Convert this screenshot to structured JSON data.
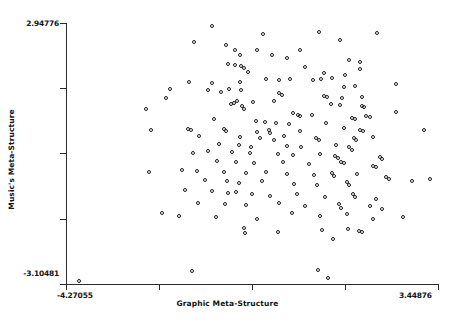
{
  "chart_data": {
    "type": "scatter",
    "title": "",
    "xlabel": "Graphic Meta-Structure",
    "ylabel": "Music's Meta-Structure",
    "xlim": [
      -4.27055,
      3.44876
    ],
    "ylim": [
      -3.10481,
      2.94776
    ],
    "xtick_labels": [
      "-4.27055",
      "3.44876"
    ],
    "ytick_labels": [
      "2.94776",
      "-3.10481"
    ],
    "xticks_count": 5,
    "yticks_count": 5,
    "grid": false,
    "legend": null,
    "marker": "open-circle",
    "marker_color": "#1c1c1c",
    "n_points": 186,
    "points": [
      [
        -1.22,
        2.86
      ],
      [
        -0.17,
        2.68
      ],
      [
        1.01,
        2.71
      ],
      [
        2.2,
        2.69
      ],
      [
        -1.6,
        2.48
      ],
      [
        -0.92,
        2.41
      ],
      [
        -0.74,
        2.31
      ],
      [
        -0.29,
        2.3
      ],
      [
        0.61,
        2.3
      ],
      [
        1.43,
        2.53
      ],
      [
        -0.63,
        2.18
      ],
      [
        0.03,
        2.19
      ],
      [
        0.33,
        2.12
      ],
      [
        -0.88,
        1.97
      ],
      [
        -0.74,
        1.94
      ],
      [
        -0.62,
        1.92
      ],
      [
        -0.55,
        1.88
      ],
      [
        0.72,
        1.9
      ],
      [
        1.62,
        2.06
      ],
      [
        1.86,
        2.01
      ],
      [
        -0.47,
        1.78
      ],
      [
        1.1,
        1.77
      ],
      [
        1.86,
        1.85
      ],
      [
        1.53,
        1.71
      ],
      [
        1.28,
        1.65
      ],
      [
        1.04,
        1.62
      ],
      [
        0.88,
        1.6
      ],
      [
        0.4,
        1.63
      ],
      [
        0.16,
        1.6
      ],
      [
        -0.09,
        1.63
      ],
      [
        -0.63,
        1.56
      ],
      [
        -1.22,
        1.54
      ],
      [
        -1.69,
        1.55
      ],
      [
        2.59,
        1.52
      ],
      [
        1.74,
        1.46
      ],
      [
        1.52,
        1.43
      ],
      [
        -0.87,
        1.4
      ],
      [
        -0.62,
        1.38
      ],
      [
        -1.04,
        1.33
      ],
      [
        -1.31,
        1.36
      ],
      [
        -2.09,
        1.4
      ],
      [
        0.16,
        1.3
      ],
      [
        0.23,
        1.26
      ],
      [
        1.11,
        1.24
      ],
      [
        1.17,
        1.21
      ],
      [
        1.47,
        1.18
      ],
      [
        1.9,
        1.2
      ],
      [
        0.07,
        1.12
      ],
      [
        -0.37,
        1.1
      ],
      [
        -0.7,
        1.11
      ],
      [
        -0.76,
        1.08
      ],
      [
        -0.82,
        1.05
      ],
      [
        -0.59,
        1.0
      ],
      [
        -0.55,
        0.94
      ],
      [
        1.24,
        1.05
      ],
      [
        1.44,
        1.02
      ],
      [
        1.9,
        1.01
      ],
      [
        1.93,
        0.97
      ],
      [
        2.6,
        0.86
      ],
      [
        0.47,
        0.83
      ],
      [
        0.57,
        0.8
      ],
      [
        0.6,
        0.76
      ],
      [
        0.85,
        0.79
      ],
      [
        1.68,
        0.73
      ],
      [
        1.75,
        0.7
      ],
      [
        1.97,
        0.77
      ],
      [
        2.06,
        0.74
      ],
      [
        -1.18,
        0.7
      ],
      [
        -0.3,
        0.66
      ],
      [
        -0.12,
        0.62
      ],
      [
        0.1,
        0.6
      ],
      [
        0.37,
        0.58
      ],
      [
        1.14,
        0.6
      ],
      [
        -1.72,
        0.47
      ],
      [
        -1.66,
        0.44
      ],
      [
        -0.97,
        0.46
      ],
      [
        -0.93,
        0.43
      ],
      [
        -0.28,
        0.4
      ],
      [
        -0.03,
        0.44
      ],
      [
        -0.01,
        0.38
      ],
      [
        0.61,
        0.42
      ],
      [
        1.52,
        0.48
      ],
      [
        1.86,
        0.45
      ],
      [
        1.91,
        0.41
      ],
      [
        -1.48,
        0.3
      ],
      [
        -0.63,
        0.28
      ],
      [
        -0.22,
        0.26
      ],
      [
        0.07,
        0.22
      ],
      [
        0.27,
        0.3
      ],
      [
        0.93,
        0.26
      ],
      [
        1.0,
        0.22
      ],
      [
        1.73,
        0.25
      ],
      [
        1.77,
        0.21
      ],
      [
        2.13,
        0.27
      ],
      [
        -1.07,
        0.12
      ],
      [
        -0.65,
        0.1
      ],
      [
        -0.42,
        0.05
      ],
      [
        0.34,
        0.08
      ],
      [
        0.62,
        0.05
      ],
      [
        1.35,
        0.1
      ],
      [
        1.62,
        0.04
      ],
      [
        1.68,
        -0.01
      ],
      [
        -1.62,
        -0.08
      ],
      [
        -1.3,
        -0.05
      ],
      [
        -0.8,
        -0.07
      ],
      [
        -0.44,
        -0.1
      ],
      [
        0.14,
        -0.11
      ],
      [
        0.46,
        -0.14
      ],
      [
        1.02,
        -0.12
      ],
      [
        1.33,
        -0.17
      ],
      [
        1.4,
        -0.21
      ],
      [
        2.26,
        -0.18
      ],
      [
        2.31,
        -0.22
      ],
      [
        -1.11,
        -0.28
      ],
      [
        -0.73,
        -0.3
      ],
      [
        -0.35,
        -0.33
      ],
      [
        0.25,
        -0.3
      ],
      [
        0.8,
        -0.35
      ],
      [
        1.46,
        -0.29
      ],
      [
        1.52,
        -0.33
      ],
      [
        2.13,
        -0.38
      ],
      [
        2.18,
        -0.42
      ],
      [
        -1.84,
        -0.48
      ],
      [
        -1.53,
        -0.5
      ],
      [
        -0.98,
        -0.53
      ],
      [
        -0.52,
        -0.55
      ],
      [
        -0.1,
        -0.52
      ],
      [
        0.33,
        -0.58
      ],
      [
        0.9,
        -0.6
      ],
      [
        1.27,
        -0.55
      ],
      [
        1.32,
        -0.62
      ],
      [
        1.78,
        -0.58
      ],
      [
        2.39,
        -0.65
      ],
      [
        -1.36,
        -0.72
      ],
      [
        -0.91,
        -0.75
      ],
      [
        -0.67,
        -0.78
      ],
      [
        -0.18,
        -0.74
      ],
      [
        0.48,
        -0.8
      ],
      [
        0.96,
        -0.83
      ],
      [
        1.58,
        -0.76
      ],
      [
        1.63,
        -0.84
      ],
      [
        2.46,
        -0.7
      ],
      [
        2.92,
        -0.75
      ],
      [
        -1.78,
        -0.95
      ],
      [
        -1.21,
        -0.98
      ],
      [
        -0.88,
        -1.02
      ],
      [
        -0.73,
        -1.0
      ],
      [
        -0.4,
        -1.05
      ],
      [
        -0.02,
        -1.08
      ],
      [
        0.55,
        -1.03
      ],
      [
        1.13,
        -1.1
      ],
      [
        1.7,
        -1.05
      ],
      [
        1.75,
        -1.12
      ],
      [
        2.19,
        -1.15
      ],
      [
        -1.52,
        -1.25
      ],
      [
        -0.95,
        -1.28
      ],
      [
        -0.52,
        -1.3
      ],
      [
        0.18,
        -1.24
      ],
      [
        0.7,
        -1.33
      ],
      [
        1.41,
        -1.27
      ],
      [
        1.46,
        -1.36
      ],
      [
        2.05,
        -1.32
      ],
      [
        2.3,
        -1.38
      ],
      [
        -1.9,
        -1.55
      ],
      [
        -1.13,
        -1.58
      ],
      [
        -0.28,
        -1.62
      ],
      [
        0.44,
        -1.48
      ],
      [
        1.03,
        -1.54
      ],
      [
        1.58,
        -1.5
      ],
      [
        2.13,
        -1.62
      ],
      [
        -0.55,
        -1.82
      ],
      [
        -0.53,
        -1.95
      ],
      [
        0.15,
        -1.92
      ],
      [
        1.07,
        -1.88
      ],
      [
        1.6,
        -1.85
      ],
      [
        1.83,
        -1.9
      ],
      [
        1.9,
        -1.92
      ],
      [
        1.3,
        -2.08
      ],
      [
        -3.98,
        -3.06
      ],
      [
        -1.63,
        -2.82
      ],
      [
        0.98,
        -2.8
      ],
      [
        1.18,
        -2.98
      ],
      [
        -2.58,
        0.92
      ],
      [
        -2.48,
        0.45
      ],
      [
        -2.52,
        -0.52
      ],
      [
        -2.18,
        1.18
      ],
      [
        -2.25,
        -1.48
      ],
      [
        3.18,
        0.45
      ],
      [
        3.3,
        -0.7
      ],
      [
        2.75,
        -1.58
      ]
    ]
  },
  "axis": {
    "y_top_label": "2.94776",
    "y_bottom_label": "-3.10481",
    "x_left_label": "-4.27055",
    "x_right_label": "3.44876",
    "x_title": "Graphic Meta-Structure",
    "y_title": "Music's Meta-Structure"
  }
}
